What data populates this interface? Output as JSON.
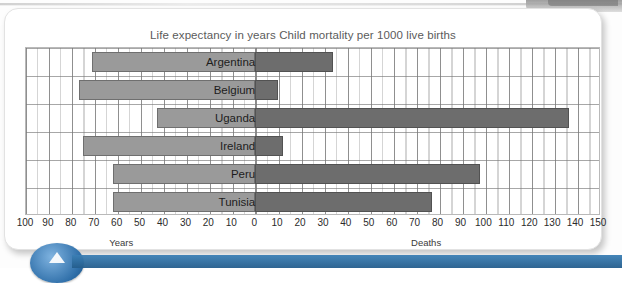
{
  "figure": {
    "title_left": "Life expectancy in years",
    "title_right": "Child mortality per 1000 live births",
    "left_caption": "Years",
    "right_caption": "Deaths"
  },
  "colors": {
    "bar_left": "#9a9a9a",
    "bar_right": "#6d6d6d",
    "grid": "#969696",
    "frame": "#b9b9b9",
    "title_text": "#5b5b5b",
    "accent_blue": "#2e6ea8"
  },
  "chart_data": {
    "type": "bar",
    "orientation": "horizontal",
    "layout": "diverging-bidirectional",
    "categories": [
      "Argentina",
      "Belgium",
      "Uganda",
      "Ireland",
      "Peru",
      "Tunisia"
    ],
    "series": [
      {
        "name": "Life expectancy in years",
        "axis": "left",
        "direction": "left",
        "unit": "years",
        "values": [
          71,
          77,
          43,
          75,
          62,
          62
        ]
      },
      {
        "name": "Child mortality per 1000 live births",
        "axis": "right",
        "direction": "right",
        "unit": "deaths per 1000 live births",
        "values": [
          34,
          10,
          137,
          12,
          98,
          77
        ]
      }
    ],
    "xlabel": "",
    "ylabel": "",
    "left_axis_label": "Years",
    "right_axis_label": "Deaths",
    "left_ticks": [
      100,
      90,
      80,
      70,
      60,
      50,
      40,
      30,
      20,
      10
    ],
    "center_tick": 0,
    "right_ticks": [
      10,
      20,
      30,
      40,
      50,
      60,
      70,
      80,
      90,
      100,
      110,
      120,
      130,
      140,
      150
    ],
    "tick_labels": [
      "100",
      "90",
      "80",
      "70",
      "60",
      "50",
      "40",
      "30",
      "20",
      "10",
      "0",
      "10",
      "20",
      "30",
      "40",
      "50",
      "60",
      "70",
      "80",
      "90",
      "100",
      "110",
      "120",
      "130",
      "140",
      "150"
    ],
    "left_max": 100,
    "right_max": 150,
    "tick_step": 10,
    "minor_tick_step": 5,
    "grid": true,
    "legend": "none"
  }
}
